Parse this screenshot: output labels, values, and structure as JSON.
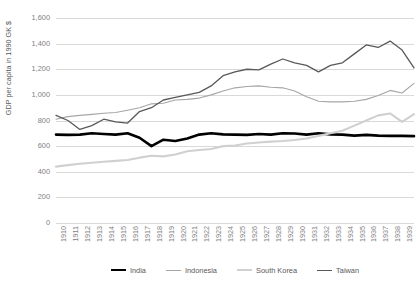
{
  "chart_data": {
    "type": "line",
    "title": "",
    "xlabel": "",
    "ylabel": "GDP per capita in 1990 GK $",
    "ylim": [
      0,
      1600
    ],
    "ytick_step": 200,
    "grid": true,
    "legend_position": "bottom",
    "yticks": [
      "0",
      "200",
      "400",
      "600",
      "800",
      "1,000",
      "1,200",
      "1,400",
      "1,600"
    ],
    "categories": [
      "1910",
      "1911",
      "1912",
      "1913",
      "1914",
      "1915",
      "1916",
      "1917",
      "1918",
      "1919",
      "1920",
      "1921",
      "1922",
      "1923",
      "1924",
      "1925",
      "1926",
      "1927",
      "1928",
      "1929",
      "1930",
      "1931",
      "1932",
      "1933",
      "1934",
      "1935",
      "1936",
      "1937",
      "1938",
      "1939",
      "1940"
    ],
    "series": [
      {
        "name": "India",
        "color": "#000000",
        "width": 2.6,
        "values": [
          690,
          688,
          690,
          700,
          695,
          690,
          700,
          665,
          600,
          650,
          640,
          660,
          690,
          700,
          692,
          690,
          688,
          695,
          690,
          700,
          698,
          690,
          700,
          692,
          690,
          682,
          688,
          682,
          680,
          680,
          678
        ]
      },
      {
        "name": "Indonesia",
        "color": "#a6a6a6",
        "width": 1.1,
        "values": [
          810,
          830,
          840,
          848,
          856,
          862,
          880,
          900,
          930,
          935,
          960,
          965,
          975,
          1000,
          1030,
          1055,
          1065,
          1070,
          1060,
          1055,
          1030,
          985,
          950,
          945,
          945,
          950,
          965,
          995,
          1035,
          1015,
          1090
        ]
      },
      {
        "name": "South Korea",
        "color": "#d0d0d0",
        "width": 2.1,
        "values": [
          440,
          452,
          462,
          470,
          478,
          485,
          492,
          510,
          525,
          520,
          535,
          560,
          570,
          578,
          600,
          605,
          620,
          628,
          635,
          640,
          648,
          660,
          680,
          700,
          720,
          760,
          800,
          840,
          855,
          790,
          850
        ]
      },
      {
        "name": "Taiwan",
        "color": "#595959",
        "width": 1.3,
        "values": [
          840,
          800,
          730,
          760,
          810,
          790,
          780,
          870,
          900,
          960,
          980,
          1000,
          1020,
          1070,
          1150,
          1180,
          1200,
          1195,
          1240,
          1280,
          1250,
          1230,
          1180,
          1230,
          1250,
          1320,
          1390,
          1370,
          1420,
          1350,
          1210
        ]
      }
    ]
  }
}
